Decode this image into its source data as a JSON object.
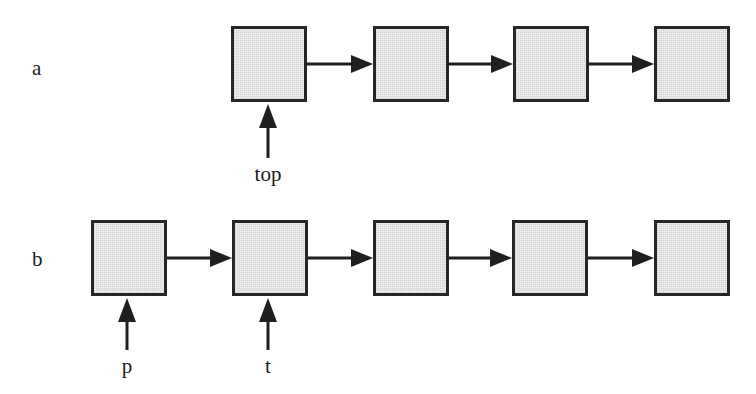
{
  "figure": {
    "type": "linked-list-diagram",
    "background": "#ffffff",
    "node_fill": "#f1f1f1",
    "stroke_color": "#262626"
  },
  "rows": [
    {
      "key": "a",
      "label": "a",
      "label_x": 32,
      "label_y": 58,
      "node_count": 4,
      "node_y": 26,
      "node_w": 76,
      "node_h": 76,
      "node_x": [
        231,
        373,
        513,
        654
      ],
      "links": [
        {
          "from_x": 307,
          "to_x": 373,
          "y": 64
        },
        {
          "from_x": 449,
          "to_x": 513,
          "y": 64
        },
        {
          "from_x": 589,
          "to_x": 654,
          "y": 64
        }
      ],
      "pointers": [
        {
          "name": "top",
          "label": "top",
          "x": 268,
          "tail_y": 158,
          "head_y": 104,
          "label_y": 164
        }
      ]
    },
    {
      "key": "b",
      "label": "b",
      "label_x": 32,
      "label_y": 249,
      "node_count": 5,
      "node_y": 220,
      "node_w": 76,
      "node_h": 76,
      "node_x": [
        91,
        232,
        373,
        512,
        654
      ],
      "links": [
        {
          "from_x": 167,
          "to_x": 232,
          "y": 258
        },
        {
          "from_x": 308,
          "to_x": 373,
          "y": 258
        },
        {
          "from_x": 449,
          "to_x": 512,
          "y": 258
        },
        {
          "from_x": 588,
          "to_x": 654,
          "y": 258
        }
      ],
      "pointers": [
        {
          "name": "p",
          "label": "p",
          "x": 127,
          "tail_y": 350,
          "head_y": 298,
          "label_y": 356
        },
        {
          "name": "t",
          "label": "t",
          "x": 268,
          "tail_y": 350,
          "head_y": 298,
          "label_y": 356
        }
      ]
    }
  ]
}
